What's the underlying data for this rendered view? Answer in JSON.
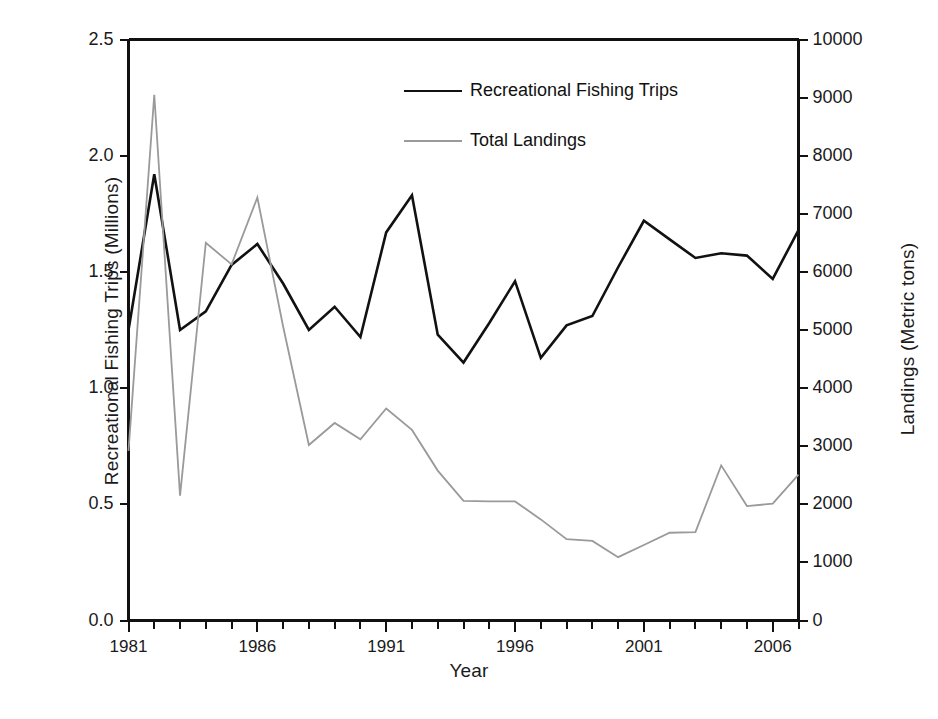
{
  "chart_data": {
    "type": "line",
    "title": "",
    "xlabel": "Year",
    "ylabel": "Recreational Fishing Trips (Millions)",
    "ylabel_right": "Landings (Metric tons)",
    "xlim": [
      1981,
      2007
    ],
    "ylim": [
      0.0,
      2.5
    ],
    "ylim_right": [
      0,
      10000
    ],
    "grid": false,
    "legend_position": "top-center",
    "x": [
      1981,
      1982,
      1983,
      1984,
      1985,
      1986,
      1987,
      1988,
      1989,
      1990,
      1991,
      1992,
      1993,
      1994,
      1995,
      1996,
      1997,
      1998,
      1999,
      2000,
      2001,
      2002,
      2003,
      2004,
      2005,
      2006,
      2007
    ],
    "xticks": [
      1981,
      1986,
      1991,
      1996,
      2001,
      2006
    ],
    "xticklabels": [
      "1981",
      "1986",
      "1991",
      "1996",
      "2001",
      "2006"
    ],
    "yticks": [
      0.0,
      0.5,
      1.0,
      1.5,
      2.0,
      2.5
    ],
    "yticklabels": [
      "0.0",
      "0.5",
      "1.0",
      "1.5",
      "2.0",
      "2.5"
    ],
    "yticks_right": [
      0,
      1000,
      2000,
      3000,
      4000,
      5000,
      6000,
      7000,
      8000,
      9000,
      10000
    ],
    "yticklabels_right": [
      "0",
      "1000",
      "2000",
      "3000",
      "4000",
      "5000",
      "6000",
      "7000",
      "8000",
      "9000",
      "10000"
    ],
    "series": [
      {
        "name": "Recreational Fishing Trips",
        "axis": "left",
        "color": "#111111",
        "linewidth": 2.6,
        "unit": "Millions",
        "values": [
          1.25,
          1.92,
          1.25,
          1.33,
          1.53,
          1.62,
          1.45,
          1.25,
          1.35,
          1.22,
          1.67,
          1.83,
          1.23,
          1.11,
          1.28,
          1.46,
          1.13,
          1.27,
          1.31,
          1.52,
          1.72,
          1.64,
          1.56,
          1.58,
          1.57,
          1.47,
          1.68
        ]
      },
      {
        "name": "Total Landings",
        "axis": "right",
        "color": "#9a9a9a",
        "linewidth": 1.8,
        "unit": "Metric tons",
        "values": [
          2920,
          9050,
          2150,
          6500,
          6130,
          7280,
          5060,
          3020,
          3400,
          3120,
          3650,
          3280,
          2580,
          2060,
          2050,
          2050,
          1740,
          1400,
          1370,
          1090,
          1300,
          1510,
          1520,
          2670,
          1970,
          2010,
          2510
        ]
      }
    ]
  },
  "legend": {
    "items": [
      {
        "label": "Recreational Fishing Trips",
        "color": "#111111",
        "width": 2.6
      },
      {
        "label": "Total Landings",
        "color": "#9a9a9a",
        "width": 1.8
      }
    ]
  },
  "axes": {
    "frame_color": "#111111",
    "background": "#ffffff"
  }
}
